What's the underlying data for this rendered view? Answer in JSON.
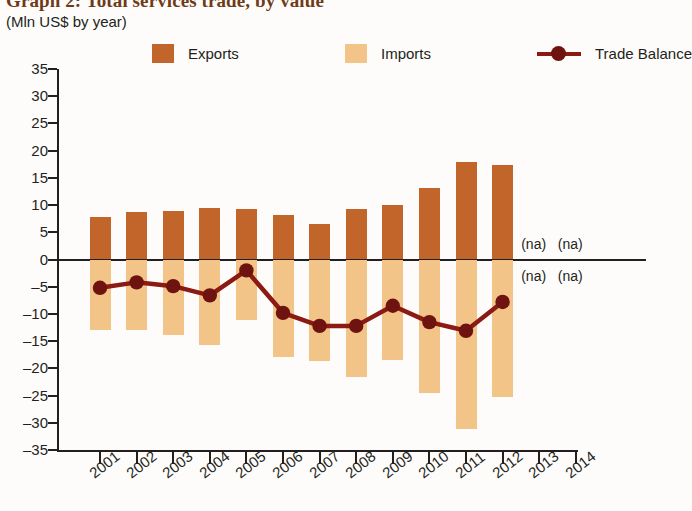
{
  "title": "Graph 2: Total services trade, by value",
  "subtitle": "(Mln US$ by year)",
  "legend": {
    "exports_label": "Exports",
    "imports_label": "Imports",
    "balance_label": "Trade Balance"
  },
  "colors": {
    "exports": "#C1652B",
    "imports": "#F3C487",
    "balance": "#8B1A13",
    "balance_marker": "#6e130f",
    "axis": "#231f20",
    "title": "#6d3b17"
  },
  "na_text": "(na)",
  "na_labels": [
    {
      "year": "2013",
      "position": "above"
    },
    {
      "year": "2014",
      "position": "above"
    },
    {
      "year": "2013",
      "position": "below"
    },
    {
      "year": "2014",
      "position": "below"
    }
  ],
  "chart_data": {
    "type": "bar",
    "title": "Graph 2: Total services trade, by value",
    "subtitle": "(Mln US$ by year)",
    "xlabel": "",
    "ylabel": "Mln US$ by year",
    "ylim": [
      -35,
      35
    ],
    "yticks": [
      35,
      30,
      25,
      20,
      15,
      10,
      5,
      0,
      -5,
      -10,
      -15,
      -20,
      -25,
      -30,
      -35
    ],
    "ytick_labels": [
      "35",
      "30",
      "25",
      "20",
      "15",
      "10",
      "5",
      "0",
      "–5",
      "–10",
      "–15",
      "–20",
      "–25",
      "–30",
      "–35"
    ],
    "grid": false,
    "legend_position": "top",
    "categories": [
      "2001",
      "2002",
      "2003",
      "2004",
      "2005",
      "2006",
      "2007",
      "2008",
      "2009",
      "2010",
      "2011",
      "2012",
      "2013",
      "2014"
    ],
    "series": [
      {
        "name": "Exports",
        "type": "bar",
        "color": "#C1652B",
        "values": [
          7.8,
          8.7,
          9.0,
          9.4,
          9.2,
          8.2,
          6.5,
          9.3,
          10.0,
          13.1,
          18.0,
          17.3,
          null,
          null
        ]
      },
      {
        "name": "Imports",
        "type": "bar",
        "color": "#F3C487",
        "values": [
          -13.0,
          -12.9,
          -13.8,
          -15.8,
          -11.2,
          -18.0,
          -18.7,
          -21.5,
          -18.5,
          -24.6,
          -31.1,
          -25.3,
          null,
          null
        ]
      },
      {
        "name": "Trade Balance",
        "type": "line",
        "color": "#8B1A13",
        "values": [
          -5.2,
          -4.2,
          -4.9,
          -6.6,
          -2.0,
          -9.8,
          -12.2,
          -12.2,
          -8.5,
          -11.5,
          -13.1,
          -7.8,
          null,
          null
        ]
      }
    ]
  }
}
